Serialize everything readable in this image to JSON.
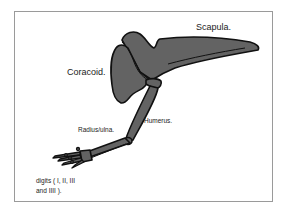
{
  "diagram": {
    "labels": {
      "scapula": "Scapula.",
      "coracoid": "Coracoid.",
      "humerus": "Humerus.",
      "radius_ulna": "Radius/ulna.",
      "digits_line1": "digits ( I, II, III",
      "digits_line2": "and IIII )."
    },
    "colors": {
      "bone_fill": "#636363",
      "bone_outline": "#111111",
      "frame_border": "#9a9a9a",
      "background": "#ffffff"
    }
  }
}
